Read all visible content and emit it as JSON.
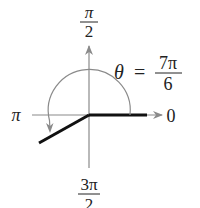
{
  "diagram": {
    "type": "polar-angle",
    "colors": {
      "axis": "#8a8a8a",
      "arc": "#8a8a8a",
      "ray": "#111111",
      "text": "#222222",
      "background": "#ffffff"
    },
    "labels": {
      "top": {
        "numerator": "π",
        "denominator": "2"
      },
      "bottom": {
        "numerator": "3π",
        "denominator": "2"
      },
      "left": "π",
      "right": "0",
      "theta": {
        "symbol": "θ",
        "equals": "=",
        "numerator": "7π",
        "denominator": "6"
      }
    },
    "angle": {
      "value_text": "7π/6",
      "degrees": 210,
      "direction": "counterclockwise"
    }
  }
}
